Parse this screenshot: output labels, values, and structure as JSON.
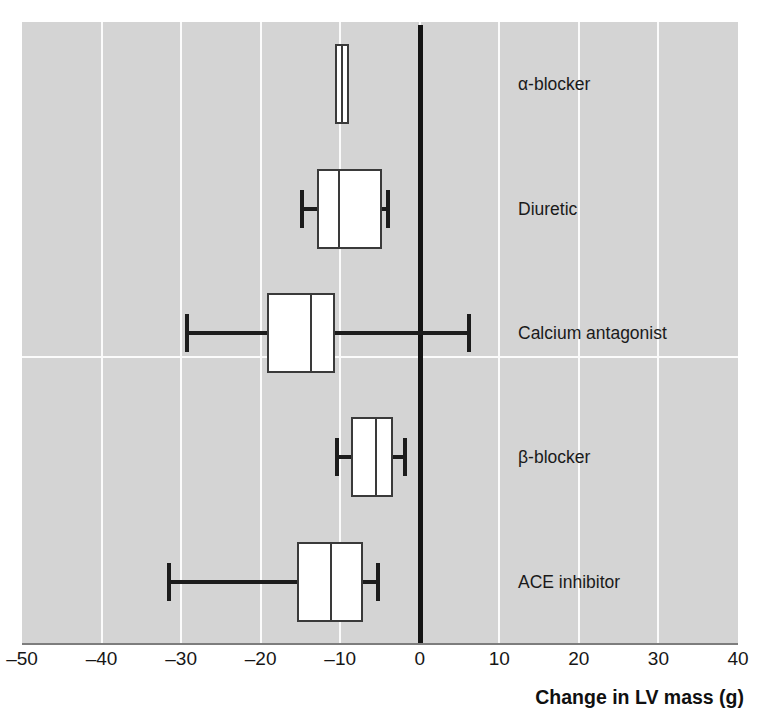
{
  "chart_data": {
    "type": "box",
    "title": "",
    "xlabel": "Change in LV mass (g)",
    "ylabel": "",
    "xlim": [
      -50,
      40
    ],
    "xticks": [
      -50,
      -40,
      -30,
      -20,
      -10,
      0,
      10,
      20,
      30,
      40
    ],
    "xticklabels": [
      "–50",
      "–40",
      "–30",
      "–20",
      "–10",
      "0",
      "10",
      "20",
      "30",
      "40"
    ],
    "grid": "vertical gridlines at every tick, one horizontal separator between Calcium antagonist and β-blocker",
    "legend": "none",
    "orientation": "horizontal",
    "reference_line": {
      "value": 0,
      "style": "thick black vertical line"
    },
    "categories": [
      "α-blocker",
      "Diuretic",
      "Calcium antagonist",
      "β-blocker",
      "ACE inhibitor"
    ],
    "boxes": [
      {
        "label": "α-blocker",
        "whisker_low": -10.7,
        "q1": -10.7,
        "median": -9.8,
        "q3": -8.9,
        "whisker_high": -8.9,
        "has_whiskers": false
      },
      {
        "label": "Diuretic",
        "whisker_low": -15.1,
        "q1": -12.9,
        "median": -10.1,
        "q3": -4.7,
        "whisker_high": -3.7,
        "has_whiskers": true
      },
      {
        "label": "Calcium antagonist",
        "whisker_low": -29.5,
        "q1": -19.2,
        "median": -13.7,
        "q3": -10.6,
        "whisker_high": 6.4,
        "has_whiskers": true
      },
      {
        "label": "β-blocker",
        "whisker_low": -10.6,
        "q1": -8.6,
        "median": -5.5,
        "q3": -3.4,
        "whisker_high": -1.6,
        "has_whiskers": true
      },
      {
        "label": "ACE inhibitor",
        "whisker_low": -31.8,
        "q1": -15.4,
        "median": -11.1,
        "q3": -7.1,
        "whisker_high": -5.0,
        "has_whiskers": true
      }
    ]
  },
  "axis": {
    "title": "Change in LV mass (g)",
    "ticks": [
      "–50",
      "–40",
      "–30",
      "–20",
      "–10",
      "0",
      "10",
      "20",
      "30",
      "40"
    ]
  },
  "colors": {
    "panel_background": "#d4d4d4",
    "gridline": "#fbfbfb",
    "box_fill": "#ffffff",
    "box_stroke": "#3a3a3a",
    "whisker": "#1c1c1c",
    "zero_line": "#141414",
    "text": "#161616"
  }
}
